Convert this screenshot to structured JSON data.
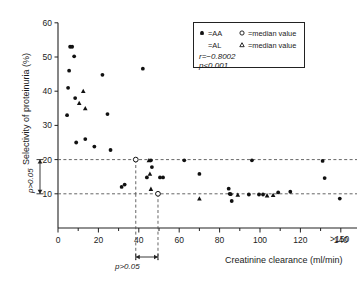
{
  "chart_data": {
    "type": "scatter",
    "title": "",
    "xlabel": "Creatinine clearance (ml/min)",
    "ylabel": "Selectivity of proteinuria (%)",
    "xlim": [
      0,
      150
    ],
    "ylim": [
      0,
      60
    ],
    "xticks": [
      0,
      20,
      40,
      60,
      80,
      100,
      120,
      140
    ],
    "xtick_labels": [
      "0",
      "20",
      "40",
      "60",
      "80",
      "100",
      "120",
      "140"
    ],
    "xaxis_end_label": ">150",
    "yticks": [
      10,
      20,
      30,
      40,
      50,
      60
    ],
    "ytick_labels": [
      "10",
      "20",
      "30",
      "40",
      "50",
      "60"
    ],
    "grid": false,
    "legend_position": "top-right",
    "series": [
      {
        "name": "AA",
        "marker": "filled-circle",
        "points": [
          [
            4.5,
            33.0
          ],
          [
            5.0,
            41.0
          ],
          [
            5.5,
            46.0
          ],
          [
            6.0,
            53.0
          ],
          [
            7.0,
            53.0
          ],
          [
            8.0,
            50.2
          ],
          [
            8.5,
            38.0
          ],
          [
            9.0,
            25.0
          ],
          [
            13.5,
            26.0
          ],
          [
            18.0,
            23.8
          ],
          [
            22.0,
            44.8
          ],
          [
            24.5,
            33.3
          ],
          [
            26.0,
            22.8
          ],
          [
            31.5,
            12.0
          ],
          [
            33.0,
            12.7
          ],
          [
            42.0,
            46.6
          ],
          [
            44.0,
            14.8
          ],
          [
            46.0,
            19.8
          ],
          [
            46.5,
            17.8
          ],
          [
            50.5,
            14.8
          ],
          [
            52.0,
            14.8
          ],
          [
            62.5,
            19.8
          ],
          [
            70.0,
            15.8
          ],
          [
            84.5,
            11.5
          ],
          [
            85.0,
            10.0
          ],
          [
            85.5,
            9.9
          ],
          [
            86.0,
            7.9
          ],
          [
            94.5,
            9.8
          ],
          [
            96.0,
            19.8
          ],
          [
            99.5,
            9.8
          ],
          [
            101.5,
            9.8
          ],
          [
            109.0,
            10.4
          ],
          [
            115.0,
            10.6
          ],
          [
            131.0,
            19.6
          ],
          [
            132.0,
            14.6
          ],
          [
            139.5,
            8.6
          ]
        ]
      },
      {
        "name": "AL",
        "marker": "filled-triangle",
        "points": [
          [
            12.5,
            40.0
          ],
          [
            13.5,
            35.0
          ],
          [
            10.5,
            36.5
          ],
          [
            45.0,
            19.8
          ],
          [
            45.5,
            15.8
          ],
          [
            46.0,
            11.4
          ],
          [
            70.0,
            8.6
          ],
          [
            89.0,
            9.7
          ],
          [
            103.5,
            9.5
          ],
          [
            106.5,
            9.6
          ]
        ]
      },
      {
        "name": "AA median value",
        "marker": "open-circle",
        "points": [
          [
            38.5,
            20.0
          ],
          [
            49.5,
            10.0
          ]
        ]
      },
      {
        "name": "AL median value",
        "marker": "open-triangle",
        "points": []
      }
    ],
    "reference_lines": [
      {
        "orientation": "horizontal",
        "value": 20,
        "style": "dashed"
      },
      {
        "orientation": "horizontal",
        "value": 10,
        "style": "dashed"
      },
      {
        "orientation": "vertical",
        "value": 38.5,
        "style": "dashed"
      },
      {
        "orientation": "vertical",
        "value": 49.5,
        "style": "dashed"
      }
    ],
    "annotations": [
      {
        "id": "p-vertical",
        "text": "p>0.05",
        "orientation": "vertical",
        "spans": "between y=10 and y=20"
      },
      {
        "id": "p-horizontal",
        "text": "p>0.05",
        "orientation": "horizontal",
        "spans": "between x=38.5 and x=49.5"
      }
    ]
  },
  "legend": {
    "rows": [
      {
        "marker": "filled-circle",
        "label": "=AA",
        "marker2": "open-circle",
        "label2": "=median value"
      },
      {
        "marker": "filled-triangle",
        "label": "=AL",
        "marker2": "open-triangle",
        "label2": "=median value"
      }
    ],
    "stats": [
      {
        "text": "r=−0.8002"
      },
      {
        "text": "p<0.001"
      }
    ]
  },
  "colors": {
    "axis": "#222222",
    "marker": "#111111",
    "dashed": "#555555",
    "background": "#ffffff"
  }
}
